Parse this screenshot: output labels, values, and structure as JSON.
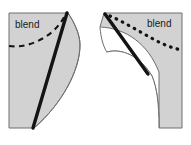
{
  "figure": {
    "type": "technical-line-drawing",
    "canvas": {
      "width": 191,
      "height": 145
    },
    "background_color": "#ffffff",
    "fill_color": "#d2d2d2",
    "outline_color": "#6e6e6e",
    "thick_line_color": "#141414",
    "dash_line_color": "#141414",
    "label_color": "#1a1a1a",
    "labels": {
      "left": "blend",
      "right": "blend"
    },
    "annotations": {
      "left_curve_style": "dashed",
      "right_curve_style": "dotted",
      "left_thick_edge": "straight diagonal seam",
      "right_thick_edge": "straight diagonal seam"
    }
  }
}
